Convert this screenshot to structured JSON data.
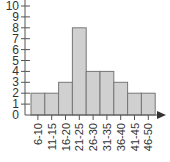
{
  "chart_data": {
    "type": "bar",
    "title": "",
    "xlabel": "",
    "ylabel": "",
    "categories": [
      "6-10",
      "11-15",
      "16-20",
      "21-25",
      "26-30",
      "31-35",
      "36-40",
      "41-45",
      "46-50"
    ],
    "values": [
      2,
      2,
      3,
      8,
      4,
      4,
      3,
      2,
      2
    ],
    "ylim": [
      0,
      10
    ],
    "yticks": [
      0,
      1,
      2,
      3,
      4,
      5,
      6,
      7,
      8,
      9,
      10
    ],
    "grid": false,
    "legend": null,
    "histogram": true,
    "bar_color": "#d0d0d0",
    "bar_edge_color": "#777777",
    "axis_color": "#555555"
  }
}
